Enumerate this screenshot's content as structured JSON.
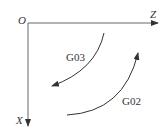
{
  "diagram": {
    "origin_label": "O",
    "z_axis_label": "Z",
    "x_axis_label": "X",
    "arcs": [
      {
        "label": "G03",
        "direction": "counterclockwise"
      },
      {
        "label": "G02",
        "direction": "clockwise"
      }
    ],
    "colors": {
      "line": "#333333",
      "background": "#ffffff"
    }
  }
}
